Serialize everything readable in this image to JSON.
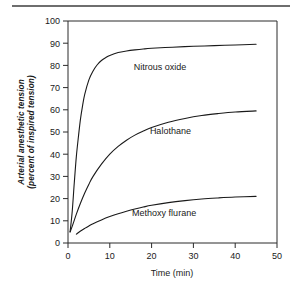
{
  "figure": {
    "has_top_rule": true,
    "background_color": "#ffffff",
    "ink_color": "#1a1a1a"
  },
  "chart_data": {
    "type": "line",
    "title": "",
    "xlabel": "Time (min)",
    "ylabel": "Arterial anesthetic tension (percent of inspired tension)",
    "ylabel_line1": "Arterial anesthetic tension",
    "ylabel_line2": "(percent of inspired tension)",
    "xlim": [
      0,
      50
    ],
    "ylim": [
      0,
      100
    ],
    "xticks": [
      0,
      10,
      20,
      30,
      40,
      50
    ],
    "xtick_labels": [
      "0",
      "10",
      "20",
      "30",
      "40",
      "50"
    ],
    "yticks": [
      0,
      10,
      20,
      30,
      40,
      50,
      60,
      70,
      80,
      90,
      100
    ],
    "ytick_labels": [
      "0",
      "10",
      "20",
      "30",
      "40",
      "50",
      "60",
      "70",
      "80",
      "90",
      "100"
    ],
    "grid": false,
    "legend_position": "inline-annotations",
    "series": [
      {
        "name": "Nitrous oxide",
        "label_x": 22.0,
        "label_y": 78.0,
        "x": [
          0.5,
          1,
          1.5,
          2,
          2.5,
          3,
          3.5,
          4,
          5,
          6,
          7,
          8,
          9,
          10,
          12,
          14,
          16,
          18,
          20,
          25,
          30,
          35,
          40,
          45
        ],
        "values": [
          5,
          14,
          27,
          39,
          48,
          56,
          62,
          67,
          73.5,
          77.5,
          80.3,
          82.2,
          83.5,
          84.5,
          85.8,
          86.5,
          87.0,
          87.4,
          87.7,
          88.2,
          88.6,
          88.9,
          89.2,
          89.5
        ]
      },
      {
        "name": "Halothane",
        "label_x": 24.5,
        "label_y": 49.0,
        "x": [
          0.5,
          1,
          2,
          3,
          4,
          5,
          6,
          8,
          10,
          12,
          14,
          16,
          18,
          20,
          24,
          28,
          32,
          36,
          40,
          45
        ],
        "values": [
          5,
          7.5,
          13,
          18,
          22.5,
          26.5,
          30,
          35.5,
          40,
          43.5,
          46.3,
          48.6,
          50.4,
          52.0,
          54.4,
          56.1,
          57.4,
          58.3,
          59.0,
          59.5
        ]
      },
      {
        "name": "Methoxy flurane",
        "label_x": 23.0,
        "label_y": 12.0,
        "x": [
          2,
          3,
          4,
          5,
          6,
          8,
          10,
          12,
          14,
          16,
          18,
          20,
          24,
          28,
          32,
          36,
          40,
          45
        ],
        "values": [
          4.0,
          5.4,
          6.6,
          7.7,
          8.7,
          10.4,
          11.9,
          13.2,
          14.3,
          15.3,
          16.2,
          17.0,
          18.2,
          19.1,
          19.8,
          20.3,
          20.7,
          21.0
        ]
      }
    ]
  }
}
